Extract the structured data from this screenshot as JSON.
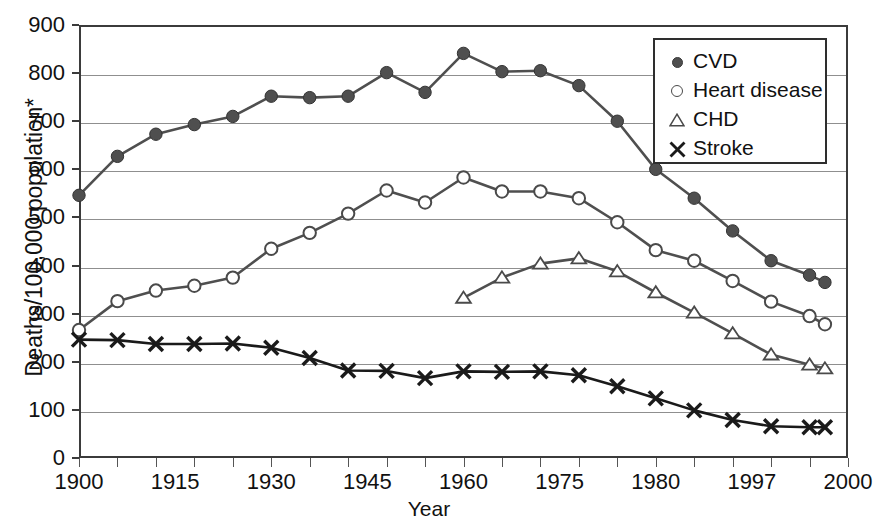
{
  "chart_data": {
    "type": "line",
    "title": "",
    "xlabel": "Year",
    "ylabel": "Deaths/100,000 population*",
    "xlim": [
      1900,
      2000
    ],
    "ylim": [
      0,
      900
    ],
    "grid": true,
    "legend_position": "top-right",
    "y_ticks": [
      0,
      100,
      200,
      300,
      400,
      500,
      600,
      700,
      800,
      900
    ],
    "x_ticks": [
      1900,
      1915,
      1930,
      1945,
      1960,
      1975,
      1980,
      1997,
      2000
    ],
    "x_tick_labels": [
      "1900",
      "1915",
      "1930",
      "1945",
      "1960",
      "1975",
      "1980",
      "1997",
      "2000"
    ],
    "x_minor_step": 5,
    "series": [
      {
        "name": "CVD",
        "marker": "filled-circle",
        "color": "#4f4f4f",
        "x": [
          1900,
          1905,
          1910,
          1915,
          1920,
          1925,
          1930,
          1935,
          1940,
          1945,
          1950,
          1955,
          1960,
          1965,
          1970,
          1975,
          1980,
          1985,
          1990,
          1995,
          1997
        ],
        "values": [
          546,
          627,
          673,
          693,
          710,
          752,
          749,
          752,
          801,
          760,
          841,
          803,
          805,
          774,
          700,
          600,
          540,
          472,
          410,
          380,
          365
        ]
      },
      {
        "name": "Heart disease",
        "marker": "open-circle",
        "color": "#4f4f4f",
        "x": [
          1900,
          1905,
          1910,
          1915,
          1920,
          1925,
          1930,
          1935,
          1940,
          1945,
          1950,
          1955,
          1960,
          1965,
          1970,
          1975,
          1980,
          1985,
          1990,
          1995,
          1997
        ],
        "values": [
          266,
          326,
          348,
          358,
          375,
          435,
          468,
          508,
          556,
          531,
          583,
          554,
          554,
          540,
          490,
          432,
          410,
          368,
          325,
          295,
          278
        ]
      },
      {
        "name": "CHD",
        "marker": "open-triangle",
        "color": "#4f4f4f",
        "x": [
          1950,
          1955,
          1960,
          1965,
          1970,
          1975,
          1980,
          1985,
          1990,
          1995,
          1997
        ],
        "values": [
          333,
          375,
          404,
          415,
          388,
          344,
          302,
          259,
          215,
          194,
          186
        ]
      },
      {
        "name": "Stroke",
        "marker": "cross",
        "color": "#1a1a1a",
        "x": [
          1900,
          1905,
          1910,
          1915,
          1920,
          1925,
          1930,
          1935,
          1940,
          1945,
          1950,
          1955,
          1960,
          1965,
          1970,
          1975,
          1980,
          1985,
          1990,
          1995,
          1997
        ],
        "values": [
          246,
          245,
          237,
          237,
          238,
          229,
          208,
          182,
          181,
          166,
          180,
          179,
          180,
          172,
          149,
          124,
          99,
          79,
          66,
          64,
          64
        ]
      }
    ]
  },
  "legend": {
    "items": [
      {
        "label": "CVD",
        "marker": "filled-circle"
      },
      {
        "label": "Heart disease",
        "marker": "open-circle"
      },
      {
        "label": "CHD",
        "marker": "open-triangle"
      },
      {
        "label": "Stroke",
        "marker": "cross"
      }
    ]
  },
  "axes": {
    "y_title": "Deaths/100,000 population*",
    "x_title": "Year"
  },
  "colors": {
    "frame": "#3b3b3b",
    "gridline": "#8f8f8f",
    "series_gray": "#4f4f4f",
    "series_black": "#1a1a1a",
    "background": "#ffffff"
  }
}
